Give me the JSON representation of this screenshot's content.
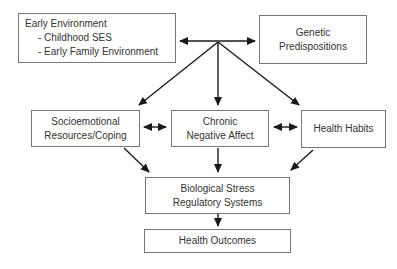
{
  "figure": {
    "background_color": "#ffffff",
    "box_border_color": "#767676",
    "arrow_color": "#1a1a1a",
    "text_color": "#333333"
  },
  "boxes": {
    "early_environment": {
      "title": "Early Environment",
      "items": [
        "- Childhood SES",
        "- Early Family Environment"
      ]
    },
    "genetic_predispositions": {
      "label": "Genetic\nPredispositions"
    },
    "socioemotional": {
      "label": "Socioemotional\nResources/Coping"
    },
    "chronic_negative_affect": {
      "label": "Chronic\nNegative Affect"
    },
    "health_habits": {
      "label": "Health Habits"
    },
    "biological_stress": {
      "label": "Biological Stress\nRegulatory Systems"
    },
    "health_outcomes": {
      "label": "Health Outcomes"
    }
  },
  "edges": [
    {
      "from": "early_environment",
      "to": "genetic_predispositions",
      "direction": "bidirectional"
    },
    {
      "from": "top-junction",
      "to": "socioemotional",
      "direction": "one-way"
    },
    {
      "from": "top-junction",
      "to": "chronic_negative_affect",
      "direction": "one-way"
    },
    {
      "from": "top-junction",
      "to": "health_habits",
      "direction": "one-way"
    },
    {
      "from": "socioemotional",
      "to": "chronic_negative_affect",
      "direction": "bidirectional"
    },
    {
      "from": "chronic_negative_affect",
      "to": "health_habits",
      "direction": "bidirectional"
    },
    {
      "from": "socioemotional",
      "to": "biological_stress",
      "direction": "one-way"
    },
    {
      "from": "chronic_negative_affect",
      "to": "biological_stress",
      "direction": "one-way"
    },
    {
      "from": "health_habits",
      "to": "biological_stress",
      "direction": "one-way"
    },
    {
      "from": "biological_stress",
      "to": "health_outcomes",
      "direction": "one-way"
    }
  ]
}
